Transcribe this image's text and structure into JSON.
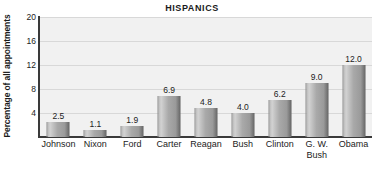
{
  "chart_data": {
    "type": "bar",
    "title": "HISPANICS",
    "xlabel": "",
    "ylabel": "Percentage of all appointments",
    "categories": [
      "Johnson",
      "Nixon",
      "Ford",
      "Carter",
      "Reagan",
      "Bush",
      "Clinton",
      "G. W.\nBush",
      "Obama"
    ],
    "values": [
      2.5,
      1.1,
      1.9,
      6.9,
      4.8,
      4.0,
      6.2,
      9.0,
      12.0
    ],
    "value_labels": [
      "2.5",
      "1.1",
      "1.9",
      "6.9",
      "4.8",
      "4.0",
      "6.2",
      "9.0",
      "12.0"
    ],
    "ylim": [
      0,
      20
    ],
    "yticks": [
      20,
      16,
      12,
      8,
      4
    ],
    "ytick_labels": [
      "20",
      "16",
      "12",
      "8",
      "4"
    ],
    "grid": true,
    "legend": "none",
    "colors": {
      "plot_background": "#f1f1f1",
      "bar_light": "#d2d2d2",
      "bar_dark": "#5e5e5e",
      "axis": "#3a3a3a",
      "gridline": "#d8d8d8",
      "text": "#1b1b1b"
    }
  }
}
